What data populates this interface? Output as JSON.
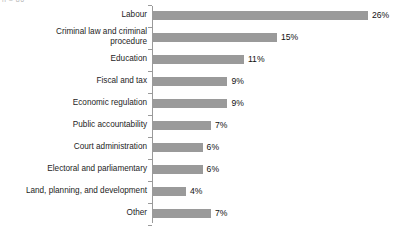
{
  "artifact": {
    "top_left_fragment": "n = 86"
  },
  "chart_data": {
    "type": "bar",
    "orientation": "horizontal",
    "title": "",
    "subtitle": "",
    "xlabel": "",
    "ylabel": "",
    "xlim": [
      0,
      26
    ],
    "grid": false,
    "legend": null,
    "value_suffix": "%",
    "bar_color": "#9a9a9a",
    "axis_color": "#9a9a9a",
    "text_color": "#1d1d1d",
    "background": "#ffffff",
    "categories": [
      "Labour",
      "Criminal law and criminal\nprocedure",
      "Education",
      "Fiscal and tax",
      "Economic regulation",
      "Public accountability",
      "Court administration",
      "Electoral and parliamentary",
      "Land, planning, and development",
      "Other"
    ],
    "values": [
      26,
      15,
      11,
      9,
      9,
      7,
      6,
      6,
      4,
      7
    ],
    "value_labels": [
      "26%",
      "15%",
      "11%",
      "9%",
      "9%",
      "7%",
      "6%",
      "6%",
      "4%",
      "7%"
    ]
  }
}
